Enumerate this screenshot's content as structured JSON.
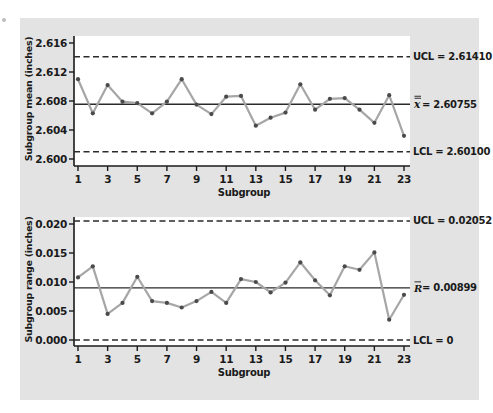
{
  "chart_data": [
    {
      "type": "line",
      "title": "",
      "xlabel": "Subgroup",
      "ylabel": "Subgroup mean (inches)",
      "x": [
        1,
        2,
        3,
        4,
        5,
        6,
        7,
        8,
        9,
        10,
        11,
        12,
        13,
        14,
        15,
        16,
        17,
        18,
        19,
        20,
        21,
        22,
        23
      ],
      "xticks": [
        1,
        3,
        5,
        7,
        9,
        11,
        13,
        15,
        17,
        19,
        21,
        23
      ],
      "yticks": [
        2.6,
        2.604,
        2.608,
        2.612,
        2.616
      ],
      "ytick_labels": [
        "2.600",
        "2.604",
        "2.608",
        "2.612",
        "2.616"
      ],
      "ylim": [
        2.5995,
        2.6172
      ],
      "series": [
        {
          "name": "Subgroup mean",
          "values": [
            2.611,
            2.6063,
            2.6102,
            2.6079,
            2.6077,
            2.6063,
            2.6079,
            2.611,
            2.6075,
            2.6062,
            2.6086,
            2.6087,
            2.6046,
            2.6057,
            2.6064,
            2.6103,
            2.6068,
            2.6083,
            2.6084,
            2.6068,
            2.605,
            2.6088,
            2.6032
          ]
        }
      ],
      "reference_lines": [
        {
          "name": "UCL",
          "value": 2.6141,
          "style": "dashed",
          "label": "UCL = 2.61410"
        },
        {
          "name": "center",
          "value": 2.60755,
          "style": "solid",
          "label_symbol": "x",
          "label_value": "= 2.60755",
          "double_bar": true
        },
        {
          "name": "LCL",
          "value": 2.601,
          "style": "dashed",
          "label": "LCL = 2.60100"
        }
      ]
    },
    {
      "type": "line",
      "title": "",
      "xlabel": "Subgroup",
      "ylabel": "Subgroup range (inches)",
      "x": [
        1,
        2,
        3,
        4,
        5,
        6,
        7,
        8,
        9,
        10,
        11,
        12,
        13,
        14,
        15,
        16,
        17,
        18,
        19,
        20,
        21,
        22,
        23
      ],
      "xticks": [
        1,
        3,
        5,
        7,
        9,
        11,
        13,
        15,
        17,
        19,
        21,
        23
      ],
      "yticks": [
        0.0,
        0.005,
        0.01,
        0.015,
        0.02
      ],
      "ytick_labels": [
        "0.000",
        "0.005",
        "0.010",
        "0.015",
        "0.020"
      ],
      "ylim": [
        -0.0009,
        0.0212
      ],
      "series": [
        {
          "name": "Subgroup range",
          "values": [
            0.0108,
            0.0127,
            0.0045,
            0.0064,
            0.0109,
            0.0067,
            0.0064,
            0.0056,
            0.0067,
            0.0083,
            0.0064,
            0.0105,
            0.01,
            0.0082,
            0.0099,
            0.0134,
            0.0103,
            0.0077,
            0.0127,
            0.0121,
            0.0151,
            0.0035,
            0.0078
          ]
        }
      ],
      "reference_lines": [
        {
          "name": "UCL",
          "value": 0.02052,
          "style": "dashed",
          "label": "UCL = 0.02052"
        },
        {
          "name": "center",
          "value": 0.00899,
          "style": "solid",
          "label_symbol": "R",
          "label_value": "= 0.00899",
          "double_bar": false
        },
        {
          "name": "LCL",
          "value": 0.0,
          "style": "dashed",
          "label": "LCL = 0"
        }
      ]
    }
  ],
  "colors": {
    "panel": "#e3e3e3",
    "plot_bg": "#ffffff",
    "line": "#a6a6a6",
    "marker": "#4a4a4a",
    "axis": "#1a1a1a",
    "ref_line": "#2a2a2a"
  }
}
